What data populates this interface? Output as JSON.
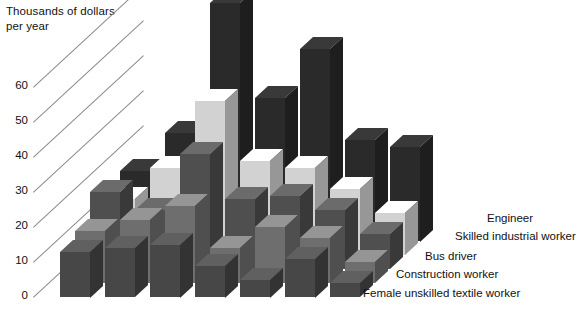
{
  "chart_data": {
    "type": "bar",
    "title": "Thousands of dollars\nper year",
    "ylabel": "Thousands of dollars per year",
    "xlabel": "",
    "ylim": [
      0,
      70
    ],
    "yticks": [
      0,
      10,
      20,
      30,
      40,
      50,
      60
    ],
    "grid": true,
    "legend_position": "right",
    "projection": "3d-grouped",
    "categories": [
      "1",
      "2",
      "3",
      "4",
      "5",
      "6",
      "7"
    ],
    "series": [
      {
        "name": "Engineer",
        "color": "#2a2a2a",
        "values": [
          20,
          31,
          68,
          41,
          55,
          29,
          27
        ]
      },
      {
        "name": "Skilled industrial worker",
        "color": "#d2d2d2",
        "values": [
          16,
          25,
          44,
          27,
          25,
          19,
          12
        ]
      },
      {
        "name": "Bus driver",
        "color": "#4f4f4f",
        "values": [
          22,
          17,
          33,
          20,
          21,
          17,
          10
        ]
      },
      {
        "name": "Construction worker",
        "color": "#6e6e6e",
        "values": [
          15,
          18,
          22,
          10,
          16,
          13,
          6
        ]
      },
      {
        "name": "Female unskilled textile worker",
        "color": "#474747",
        "values": [
          13,
          14,
          15,
          9,
          5,
          11,
          4
        ]
      }
    ],
    "yticklabels": [
      "60",
      "50",
      "40",
      "30",
      "20",
      "10",
      "0"
    ]
  },
  "legend": {
    "items": [
      {
        "label": "Engineer"
      },
      {
        "label": "Skilled industrial worker"
      },
      {
        "label": "Bus driver"
      },
      {
        "label": "Construction worker"
      },
      {
        "label": "Female unskilled textile worker"
      }
    ]
  }
}
